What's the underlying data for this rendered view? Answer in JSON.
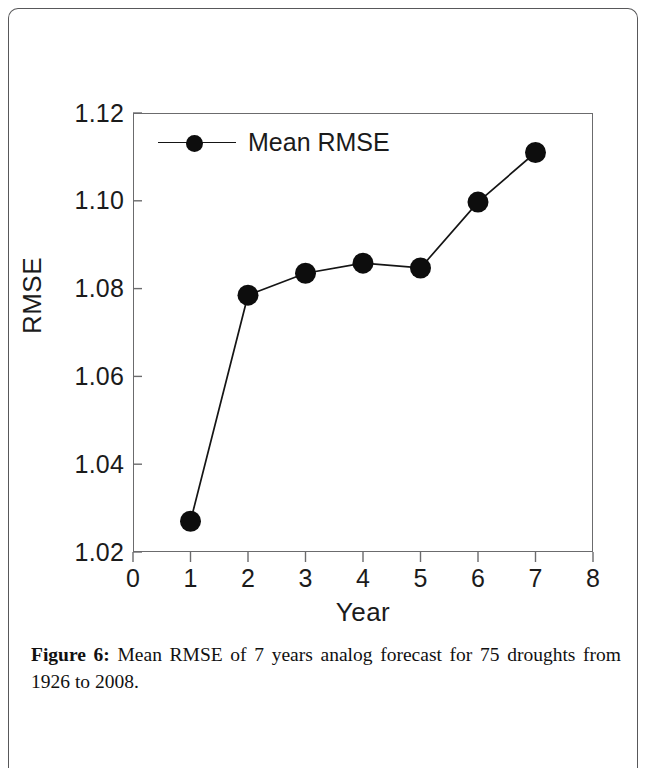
{
  "figure": {
    "caption_label": "Figure 6:",
    "caption_text": " Mean RMSE of 7 years analog forecast for 75 droughts from 1926 to 2008."
  },
  "chart_data": {
    "type": "line",
    "title": "",
    "xlabel": "Year",
    "ylabel": "RMSE",
    "x": [
      1,
      2,
      3,
      4,
      5,
      6,
      7
    ],
    "values": [
      1.027,
      1.0785,
      1.0835,
      1.0858,
      1.0847,
      1.0997,
      1.111
    ],
    "series": [
      {
        "name": "Mean RMSE",
        "values": [
          1.027,
          1.0785,
          1.0835,
          1.0858,
          1.0847,
          1.0997,
          1.111
        ]
      }
    ],
    "xlim": [
      0,
      8
    ],
    "ylim": [
      1.02,
      1.12
    ],
    "xticks": [
      "0",
      "1",
      "2",
      "3",
      "4",
      "5",
      "6",
      "7",
      "8"
    ],
    "xtick_values": [
      0,
      1,
      2,
      3,
      4,
      5,
      6,
      7,
      8
    ],
    "yticks": [
      "1.02",
      "1.04",
      "1.06",
      "1.08",
      "1.10",
      "1.12"
    ],
    "ytick_values": [
      1.02,
      1.04,
      1.06,
      1.08,
      1.1,
      1.12
    ],
    "grid": false,
    "legend": {
      "position": "top-left-inside",
      "entries": [
        "Mean RMSE"
      ]
    },
    "marker": "filled-circle",
    "line_color": "#151515",
    "marker_color": "#0d0d0d"
  }
}
